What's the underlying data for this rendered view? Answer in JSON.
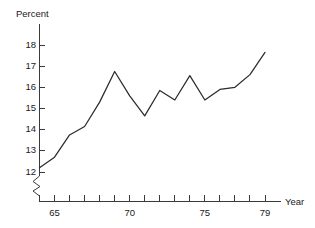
{
  "chart_data": {
    "type": "line",
    "title": "",
    "subtitle": "",
    "xlabel": "Year",
    "ylabel": "Percent",
    "grid": false,
    "legend": null,
    "xlim": [
      64,
      79
    ],
    "ylim": [
      11.8,
      18.4
    ],
    "y_axis_break": true,
    "y_tick_labels": [
      "18",
      "17",
      "16",
      "15",
      "14",
      "13",
      "12"
    ],
    "y_tick_values": [
      18,
      17,
      16,
      15,
      14,
      13,
      12
    ],
    "x_tick_values": [
      64,
      65,
      66,
      67,
      68,
      69,
      70,
      71,
      72,
      73,
      74,
      75,
      76,
      77,
      78,
      79
    ],
    "x_tick_labels_shown": [
      "65",
      "70",
      "75",
      "79"
    ],
    "x_labeled_values": [
      65,
      70,
      75,
      79
    ],
    "x": [
      64,
      65,
      66,
      67,
      68,
      69,
      70,
      71,
      72,
      73,
      74,
      75,
      76,
      77,
      78,
      79
    ],
    "values": [
      12.2,
      12.7,
      13.75,
      14.15,
      15.3,
      16.75,
      15.6,
      14.65,
      15.85,
      15.4,
      16.55,
      15.4,
      15.9,
      16.0,
      16.6,
      17.65
    ],
    "series": [
      {
        "name": "Percent",
        "values": [
          12.2,
          12.7,
          13.75,
          14.15,
          15.3,
          16.75,
          15.6,
          14.65,
          15.85,
          15.4,
          16.55,
          15.4,
          15.9,
          16.0,
          16.6,
          17.65
        ]
      }
    ],
    "line_color": "#2b2b2b",
    "axis_color": "#3a3a3a",
    "background_color": "#ffffff"
  },
  "axes": {
    "y_title": "Percent",
    "x_title": "Year"
  }
}
